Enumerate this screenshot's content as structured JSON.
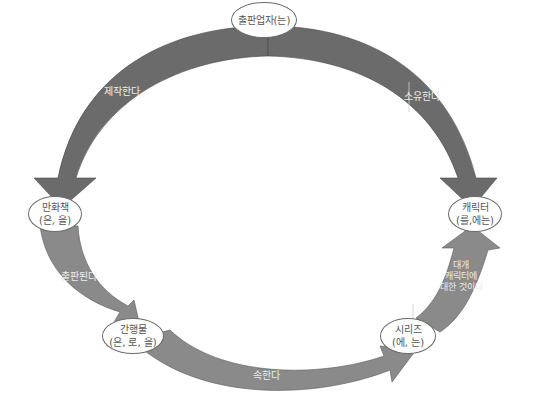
{
  "colors": {
    "arrow_dark": "#6b6b6b",
    "arrow_light": "#888888",
    "node_fill": "#ffffff",
    "node_border": "#6a6a6a",
    "node_text": "#555555",
    "label_text": "#ececec"
  },
  "nodes": {
    "publisher": {
      "line1": "출판업자(는)"
    },
    "comic": {
      "line1": "만화책",
      "line2": "(은, 을)"
    },
    "character": {
      "line1": "캐릭터",
      "line2": "(를,에는)"
    },
    "periodical": {
      "line1": "간행물",
      "line2": "(은, 로, 을)"
    },
    "series": {
      "line1": "시리즈",
      "line2": "(에, 는)"
    }
  },
  "edges": {
    "produces": {
      "label": "제작한다"
    },
    "owns": {
      "label": "소유한다"
    },
    "publishes": {
      "label": "출판된다"
    },
    "belongs": {
      "label": "속한다"
    },
    "about": {
      "line1": "대개",
      "line2": "캐릭터에",
      "line3": "대한 것이다"
    }
  }
}
